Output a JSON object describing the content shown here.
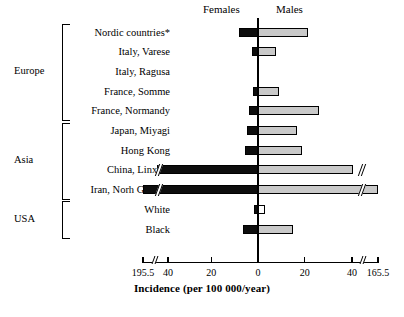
{
  "chart_data": {
    "type": "bar",
    "orientation": "horizontal-pyramid",
    "title": "",
    "xlabel": "Incidence (per 100 000/year)",
    "ylabel": "",
    "axis_note": "broken axis on both ends",
    "xtick_labels": [
      "195.5",
      "40",
      "20",
      "0",
      "20",
      "40",
      "165.5"
    ],
    "xtick_values": [
      -195.5,
      -40,
      -20,
      0,
      20,
      40,
      165.5
    ],
    "legend": [
      "Females",
      "Males"
    ],
    "series": [
      {
        "name": "Females",
        "color": "#0d0d0d",
        "side": "left",
        "values": [
          8.0,
          2.5,
          0,
          2.0,
          4.0,
          4.5,
          5.5,
          110.0,
          195.5,
          1.5,
          6.5
        ]
      },
      {
        "name": "Males",
        "color": "#c9c9c9",
        "side": "right",
        "values": [
          21.5,
          7.5,
          0,
          9.0,
          26.0,
          16.5,
          19.0,
          47.0,
          165.5,
          3.0,
          15.0
        ]
      }
    ],
    "categories": [
      "Nordic countries*",
      "Italy, Varese",
      "Italy, Ragusa",
      "France, Somme",
      "France, Normandy",
      "Japan, Miyagi",
      "Hong Kong",
      "China, Linxian",
      "Iran, Norh Gonbad",
      "White",
      "Black"
    ],
    "groups": [
      {
        "label": "Europe",
        "first": 0,
        "last": 4
      },
      {
        "label": "Asia",
        "first": 5,
        "last": 8
      },
      {
        "label": "USA",
        "first": 9,
        "last": 10
      }
    ],
    "broken_rows_female": [
      7,
      8
    ],
    "broken_rows_male": [
      7,
      8
    ],
    "footnote_marker": "*"
  }
}
